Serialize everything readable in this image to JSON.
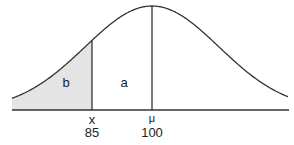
{
  "diagram": {
    "type": "normal-distribution",
    "regions": {
      "left_shaded": "b",
      "middle": "a"
    },
    "markers": [
      {
        "symbol": "x",
        "value": "85"
      },
      {
        "symbol": "μ",
        "value": "100"
      }
    ],
    "colors": {
      "shade": "#e4e4e4",
      "line": "#333333"
    }
  }
}
